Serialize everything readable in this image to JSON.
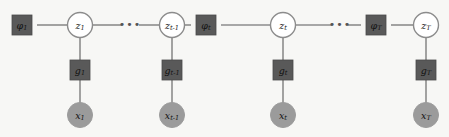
{
  "figure": {
    "background_color": "#f7f7f5",
    "width": 449,
    "height": 137
  },
  "palette": {
    "factor_fill": "#595959",
    "latent_fill": "#ffffff",
    "latent_stroke": "#8c8c8c",
    "observed_fill": "#9b9b9b",
    "edge_color": "#8c8c8c",
    "label_color": "#111111"
  },
  "ellipsis": {
    "glyph": "•••",
    "items": [
      {
        "name": "ellipsis-left",
        "x": 130,
        "y": 25
      },
      {
        "name": "ellipsis-right",
        "x": 340,
        "y": 25
      }
    ]
  },
  "graph": {
    "transition_factors": [
      {
        "id": "phi-1",
        "base": "φ",
        "sub": "1",
        "x": 22,
        "y": 25
      },
      {
        "id": "phi-t",
        "base": "φ",
        "sub": "t",
        "x": 206,
        "y": 25
      },
      {
        "id": "phi-T",
        "base": "φ",
        "sub": "T",
        "x": 376,
        "y": 25
      }
    ],
    "latent_states": [
      {
        "id": "z-1",
        "base": "z",
        "sub": "1",
        "x": 80,
        "y": 25
      },
      {
        "id": "z-tm1",
        "base": "z",
        "sub": "t-1",
        "x": 172,
        "y": 25
      },
      {
        "id": "z-t",
        "base": "z",
        "sub": "t",
        "x": 283,
        "y": 25
      },
      {
        "id": "z-T",
        "base": "z",
        "sub": "T",
        "x": 426,
        "y": 25
      }
    ],
    "emission_factors": [
      {
        "id": "g-1",
        "base": "g",
        "sub": "1",
        "x": 80,
        "y": 70
      },
      {
        "id": "g-tm1",
        "base": "g",
        "sub": "t-1",
        "x": 172,
        "y": 70
      },
      {
        "id": "g-t",
        "base": "g",
        "sub": "t",
        "x": 283,
        "y": 70
      },
      {
        "id": "g-T",
        "base": "g",
        "sub": "T",
        "x": 426,
        "y": 70
      }
    ],
    "observations": [
      {
        "id": "x-1",
        "base": "x",
        "sub": "1",
        "x": 80,
        "y": 115
      },
      {
        "id": "x-tm1",
        "base": "x",
        "sub": "t-1",
        "x": 172,
        "y": 115
      },
      {
        "id": "x-t",
        "base": "x",
        "sub": "t",
        "x": 283,
        "y": 115
      },
      {
        "id": "x-T",
        "base": "x",
        "sub": "T",
        "x": 426,
        "y": 115
      }
    ],
    "horizontal_edges": [
      {
        "name": "edge-phi1-z1",
        "x1": 37,
        "x2": 68,
        "y": 25
      },
      {
        "name": "edge-z1-ellipsis",
        "x1": 92,
        "x2": 122,
        "y": 25
      },
      {
        "name": "edge-ellipsis-ztm1",
        "x1": 139,
        "x2": 160,
        "y": 25
      },
      {
        "name": "edge-ztm1-phit",
        "x1": 184,
        "x2": 191,
        "y": 25
      },
      {
        "name": "edge-phit-zt",
        "x1": 221,
        "x2": 271,
        "y": 25
      },
      {
        "name": "edge-zt-ellipsis",
        "x1": 295,
        "x2": 332,
        "y": 25
      },
      {
        "name": "edge-ellipsis-phiT",
        "x1": 348,
        "x2": 361,
        "y": 25
      },
      {
        "name": "edge-phiT-zT",
        "x1": 391,
        "x2": 414,
        "y": 25
      }
    ],
    "vertical_edges": [
      {
        "name": "edge-z1-g1",
        "x": 80,
        "y1": 37,
        "y2": 60
      },
      {
        "name": "edge-g1-x1",
        "x": 80,
        "y1": 80,
        "y2": 103
      },
      {
        "name": "edge-ztm1-gtm1",
        "x": 172,
        "y1": 37,
        "y2": 60
      },
      {
        "name": "edge-gtm1-xtm1",
        "x": 172,
        "y1": 80,
        "y2": 103
      },
      {
        "name": "edge-zt-gt",
        "x": 283,
        "y1": 37,
        "y2": 60
      },
      {
        "name": "edge-gt-xt",
        "x": 283,
        "y1": 80,
        "y2": 103
      },
      {
        "name": "edge-zT-gT",
        "x": 426,
        "y1": 37,
        "y2": 60
      },
      {
        "name": "edge-gT-xT",
        "x": 426,
        "y1": 80,
        "y2": 103
      }
    ],
    "geometry": {
      "square_size": 20,
      "latent_radius": 12.5,
      "observed_radius": 12.5
    }
  }
}
